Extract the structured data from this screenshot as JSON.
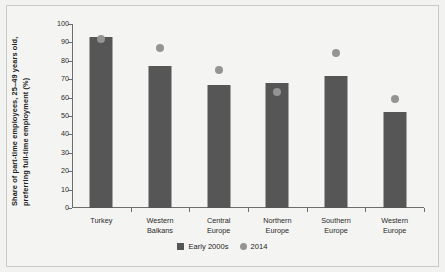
{
  "chart_data": {
    "type": "bar",
    "title": "",
    "xlabel": "",
    "ylabel_line_1": "Share of part-time employees, 25–49 years old,",
    "ylabel_line_2": "preferring full-time employment (%)",
    "categories": [
      [
        "Turkey"
      ],
      [
        "Western",
        "Balkans"
      ],
      [
        "Central",
        "Europe"
      ],
      [
        "Northern",
        "Europe"
      ],
      [
        "Southern",
        "Europe"
      ],
      [
        "Western",
        "Europe"
      ]
    ],
    "series": [
      {
        "name": "Early 2000s",
        "type": "bar",
        "color": "#565656",
        "values": [
          93,
          77,
          67,
          68,
          72,
          52
        ]
      },
      {
        "name": "2014",
        "type": "scatter",
        "color": "#949494",
        "values": [
          92,
          87,
          75,
          63,
          84,
          59
        ]
      }
    ],
    "ylim": [
      0,
      100
    ],
    "yticks": [
      100,
      90,
      80,
      70,
      60,
      50,
      40,
      30,
      20,
      10,
      0
    ],
    "grid": false,
    "legend_position": "bottom-center"
  }
}
